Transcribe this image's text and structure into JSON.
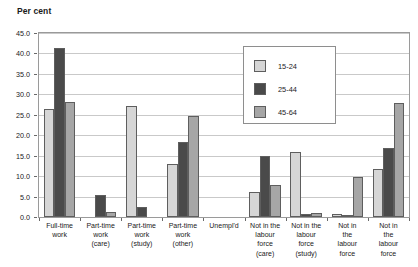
{
  "chart_data": {
    "type": "bar",
    "title": "Per cent",
    "xlabel": "",
    "ylabel": "Per cent",
    "ylim": [
      0.0,
      45.0
    ],
    "ytick_step": 5.0,
    "ytick_labels": [
      "0.0",
      "5.0",
      "10.0",
      "15.0",
      "20.0",
      "25.0",
      "30.0",
      "35.0",
      "40.0",
      "45.0"
    ],
    "grid": true,
    "legend_position": "upper-center",
    "categories": [
      "Full-time work",
      "Part-time work (care)",
      "Part-time work (study)",
      "Part-time work (other)",
      "Unempl'd",
      "Not in the labour force (care)",
      "Not in the labour force (study)",
      "Not in the labour force",
      "Not in the labour force"
    ],
    "category_lines": [
      [
        "Full-time",
        "work"
      ],
      [
        "Part-time",
        "work",
        "(care)"
      ],
      [
        "Part-time",
        "work",
        "(study)"
      ],
      [
        "Part-time",
        "work",
        "(other)"
      ],
      [
        "Unempl'd"
      ],
      [
        "Not in the",
        "labour",
        "force",
        "(care)"
      ],
      [
        "Not in the",
        "labour",
        "force",
        "(study)"
      ],
      [
        "Not in",
        "the",
        "labour",
        "force"
      ],
      [
        "Not in",
        "the",
        "labour",
        "force"
      ]
    ],
    "series": [
      {
        "name": "15-24",
        "color": "#d6d6d6",
        "values": [
          26.3,
          0.0,
          27.2,
          13.0,
          0.0,
          6.2,
          15.8,
          0.7,
          11.8
        ]
      },
      {
        "name": "25-44",
        "color": "#4a4a4a",
        "values": [
          41.3,
          5.5,
          2.4,
          18.3,
          0.0,
          15.0,
          0.7,
          0.6,
          16.8
        ]
      },
      {
        "name": "45-64",
        "color": "#a6a6a6",
        "values": [
          28.1,
          1.2,
          0.0,
          24.7,
          0.0,
          7.8,
          1.0,
          9.8,
          27.9
        ]
      }
    ]
  },
  "legend": {
    "items": [
      {
        "label": "15-24",
        "color": "#d6d6d6"
      },
      {
        "label": "25-44",
        "color": "#4a4a4a"
      },
      {
        "label": "45-64",
        "color": "#a6a6a6"
      }
    ]
  }
}
